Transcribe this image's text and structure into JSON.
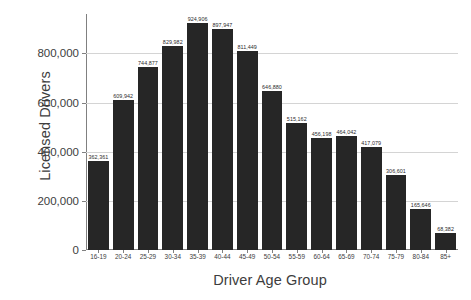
{
  "chart_data": {
    "type": "bar",
    "title": "",
    "xlabel": "Driver Age Group",
    "ylabel": "Licensed Drivers",
    "categories": [
      "16-19",
      "20-24",
      "25-29",
      "30-34",
      "35-39",
      "40-44",
      "45-49",
      "50-54",
      "55-59",
      "60-64",
      "65-69",
      "70-74",
      "75-79",
      "80-84",
      "85+"
    ],
    "values": [
      362361,
      609942,
      744877,
      829982,
      924906,
      897947,
      811449,
      646880,
      515162,
      456198,
      464042,
      417079,
      306601,
      165646,
      68382
    ],
    "value_labels": [
      "362,361",
      "609,942",
      "744,877",
      "829,982",
      "924,906",
      "897,947",
      "811,449",
      "646,880",
      "515,162",
      "456,198",
      "464,042",
      "417,079",
      "306,601",
      "165,646",
      "68,382"
    ],
    "ytick_values": [
      0,
      200000,
      400000,
      600000,
      800000
    ],
    "ytick_labels": [
      "0",
      "200,000",
      "400,000",
      "600,000",
      "800,000"
    ],
    "ylim": [
      0,
      960000
    ],
    "grid": "horizontal",
    "legend": "none",
    "bar_color": "#262626",
    "grid_color": "#d4d4d4",
    "axis_color": "#808080",
    "text_color": "#3d3d3d"
  }
}
